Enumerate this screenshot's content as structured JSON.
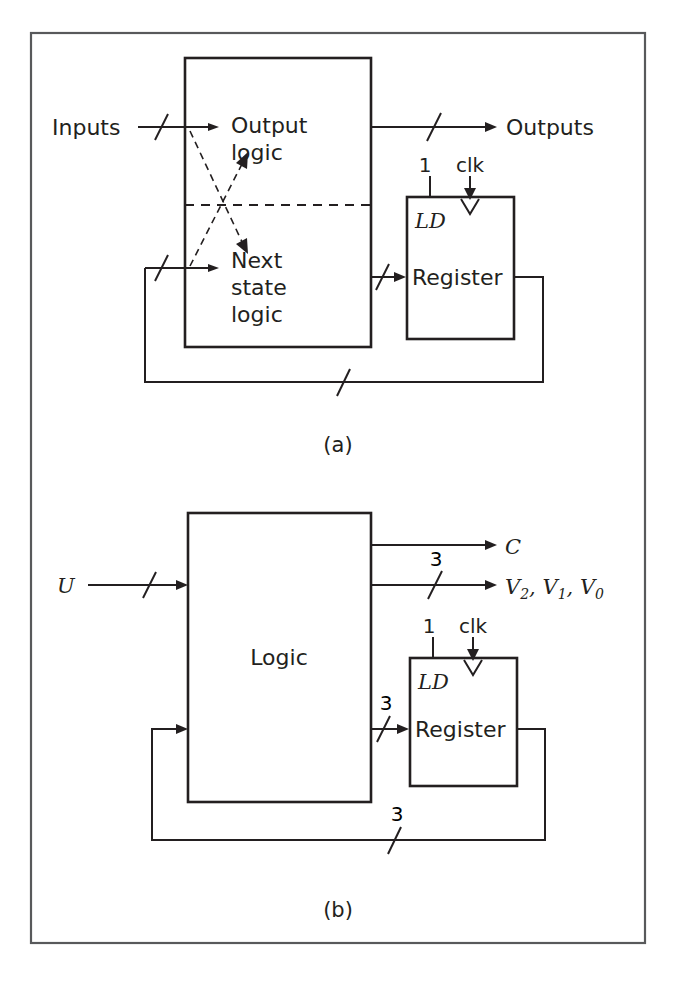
{
  "figure": {
    "frame": {
      "color": "#58595b"
    },
    "line_color": "#231f20"
  },
  "diagram_a": {
    "caption": "(a)",
    "blocks": [
      {
        "name": "output-logic",
        "label_line1": "Output",
        "label_line2": "logic"
      },
      {
        "name": "next-state-logic",
        "label_line1": "Next",
        "label_line2": "state",
        "label_line3": "logic"
      },
      {
        "name": "register",
        "label": "Register",
        "load_label": "LD",
        "load_width": "1",
        "clock_label": "clk"
      }
    ],
    "signals": {
      "input_label": "Inputs",
      "output_label": "Outputs"
    }
  },
  "diagram_b": {
    "caption": "(b)",
    "blocks": [
      {
        "name": "logic",
        "label": "Logic"
      },
      {
        "name": "register",
        "label": "Register",
        "load_label": "LD",
        "load_width": "1",
        "clock_label": "clk"
      }
    ],
    "signals": {
      "input_label": "U",
      "output_c": "C",
      "output_v": "V",
      "output_v_subs": [
        "2",
        "1",
        "0"
      ],
      "output_v_full": "V2, V1, V0",
      "bus_width_outputs": "3",
      "bus_width_register_in": "3",
      "bus_width_feedback": "3"
    }
  }
}
